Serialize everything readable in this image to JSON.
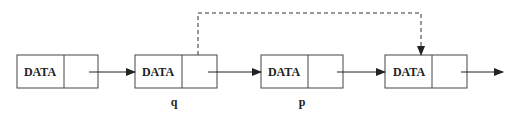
{
  "diagram": {
    "type": "singly-linked-list",
    "nodes": [
      {
        "id": "n1",
        "label": "DATA",
        "pointer_label": ""
      },
      {
        "id": "n2",
        "label": "DATA",
        "pointer_label": "q"
      },
      {
        "id": "n3",
        "label": "DATA",
        "pointer_label": "p"
      },
      {
        "id": "n4",
        "label": "DATA",
        "pointer_label": ""
      }
    ],
    "edges": [
      {
        "from": "n1",
        "to": "n2",
        "style": "solid"
      },
      {
        "from": "n2",
        "to": "n3",
        "style": "solid"
      },
      {
        "from": "n3",
        "to": "n4",
        "style": "solid"
      },
      {
        "from": "n4",
        "to": "next",
        "style": "solid"
      },
      {
        "from": "n2",
        "to": "n4",
        "style": "dashed"
      }
    ],
    "colors": {
      "stroke": "#333333",
      "background": "#ffffff"
    }
  }
}
